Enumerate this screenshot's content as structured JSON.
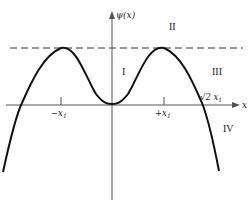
{
  "figure": {
    "y_axis_label": "ψ(x)",
    "x_axis_label": "x",
    "regions": {
      "I": "I",
      "II": "II",
      "III": "III",
      "IV": "IV"
    },
    "ticks": {
      "neg_x1": "−x",
      "neg_x1_sub": "1",
      "pos_x1": "+x",
      "pos_x1_sub": "1"
    },
    "root_label": "√2 x",
    "root_label_sub": "1",
    "colors": {
      "curve": "#111111",
      "axes": "#555555",
      "dashed": "#333333"
    }
  }
}
